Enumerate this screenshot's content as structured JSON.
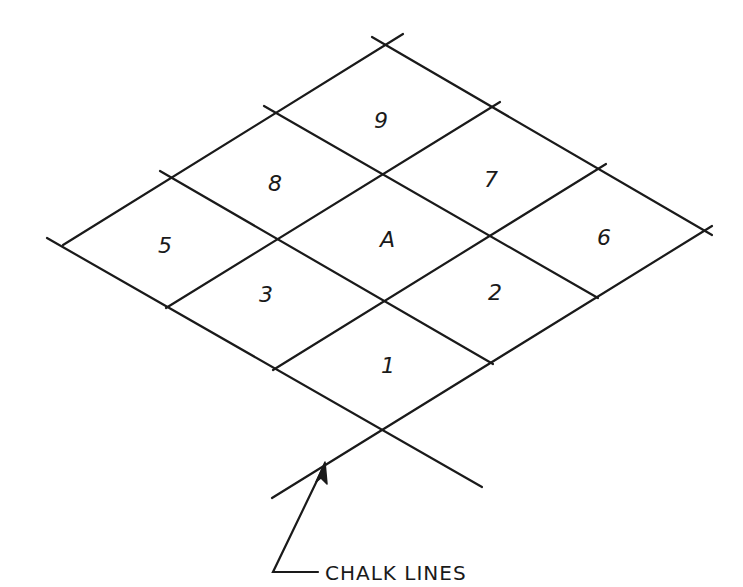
{
  "diagram": {
    "title": "",
    "grid": {
      "rows": 3,
      "cols": 3,
      "origin": [
        385,
        45
      ],
      "step_left": [
        -107,
        66.5
      ],
      "step_right": [
        106,
        62
      ],
      "cells": [
        {
          "row": 0,
          "col": 0,
          "label": "9"
        },
        {
          "row": 0,
          "col": 1,
          "label": "7"
        },
        {
          "row": 0,
          "col": 2,
          "label": "6"
        },
        {
          "row": 1,
          "col": 0,
          "label": "8"
        },
        {
          "row": 1,
          "col": 1,
          "label": "A"
        },
        {
          "row": 1,
          "col": 2,
          "label": "2"
        },
        {
          "row": 2,
          "col": 0,
          "label": "5"
        },
        {
          "row": 2,
          "col": 1,
          "label": "3"
        },
        {
          "row": 2,
          "col": 2,
          "label": "1"
        }
      ]
    },
    "labels": {
      "cell_9": "9",
      "cell_7": "7",
      "cell_6": "6",
      "cell_8": "8",
      "cell_A": "A",
      "cell_2": "2",
      "cell_5": "5",
      "cell_3": "3",
      "cell_1": "1",
      "caption": "CHALK LINES"
    },
    "annotation": {
      "text": "CHALK LINES",
      "arrow_target": [
        325,
        463
      ],
      "arrow_corner": [
        275,
        572
      ]
    },
    "colors": {
      "ink": "#1a1a1a",
      "paper": "#ffffff"
    }
  }
}
